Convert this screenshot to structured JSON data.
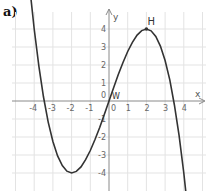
{
  "figure": {
    "panel_label": "a)"
  },
  "chart_data": {
    "type": "line",
    "title": "",
    "xlabel": "x",
    "ylabel": "y",
    "function_shape": "cubic, f(x) = -x^3/4 + 3x (odd, through origin)",
    "xlim": [
      -5.8,
      5.2
    ],
    "ylim": [
      -5,
      5.6
    ],
    "grid": true,
    "x_ticks": [
      -4,
      -3,
      -2,
      -1,
      0,
      1,
      2,
      3,
      4
    ],
    "x_tick_labels": [
      "-4",
      "-3",
      "-2",
      "-1",
      "0",
      "1",
      "2",
      "3",
      "4"
    ],
    "y_ticks": [
      -4,
      -3,
      -2,
      -1,
      1,
      2,
      3,
      4
    ],
    "y_tick_labels": [
      "-4",
      "-3",
      "-2",
      "-1",
      "1",
      "2",
      "3",
      "4"
    ],
    "origin_label": "0",
    "points_of_interest": [
      {
        "name": "H",
        "x": 2,
        "y": 4,
        "kind": "local maximum"
      },
      {
        "name": "W",
        "x": 0,
        "y": 0,
        "kind": "inflection point"
      }
    ],
    "series": [
      {
        "name": "curve",
        "color": "#333333",
        "x": [
          -4.2,
          -4.0,
          -3.75,
          -3.5,
          -3.25,
          -3.0,
          -2.75,
          -2.5,
          -2.25,
          -2.0,
          -1.75,
          -1.5,
          -1.25,
          -1.0,
          -0.75,
          -0.5,
          -0.25,
          0,
          0.25,
          0.5,
          0.75,
          1.0,
          1.25,
          1.5,
          1.75,
          2.0,
          2.25,
          2.5,
          2.75,
          3.0,
          3.25,
          3.5,
          3.75,
          4.0,
          4.2
        ],
        "y": [
          5.92,
          4.0,
          1.93,
          0.22,
          -1.17,
          -2.25,
          -3.05,
          -3.59,
          -3.9,
          -4.0,
          -3.91,
          -3.66,
          -3.26,
          -2.75,
          -2.14,
          -1.47,
          -0.75,
          0,
          0.75,
          1.47,
          2.14,
          2.75,
          3.26,
          3.66,
          3.91,
          4.0,
          3.9,
          3.59,
          3.05,
          2.25,
          1.17,
          -0.22,
          -1.93,
          -4.0,
          -5.92
        ]
      }
    ]
  },
  "colors": {
    "grid": "#e3e3e3",
    "axis": "#8a8a8a",
    "curve": "#333333",
    "tick_text": "#666666"
  }
}
